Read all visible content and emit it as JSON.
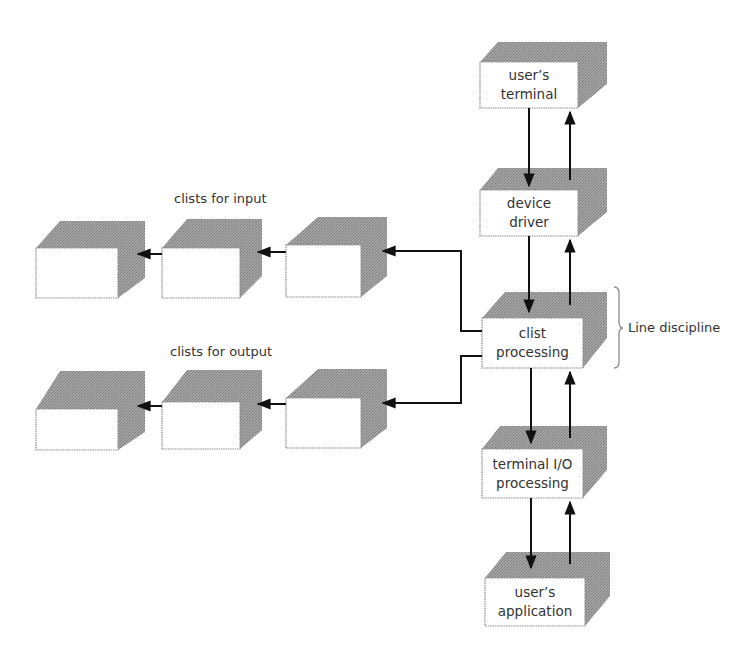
{
  "diagram": {
    "colors": {
      "background": "#ffffff",
      "box_face": "#ffffff",
      "box_shade": "#9a9a9a",
      "box_border": "#8c8c8c",
      "arrow": "#111111",
      "text": "#333333"
    },
    "stack": [
      {
        "id": "users-terminal",
        "line1": "user’s",
        "line2": "terminal"
      },
      {
        "id": "device-driver",
        "line1": "device",
        "line2": "driver"
      },
      {
        "id": "clist-processing",
        "line1": "clist",
        "line2": "processing"
      },
      {
        "id": "terminal-io-processing",
        "line1": "terminal I/O",
        "line2": "processing"
      },
      {
        "id": "users-application",
        "line1": "user’s",
        "line2": "application"
      }
    ],
    "groups": {
      "input": {
        "label": "clists for input",
        "count": 3
      },
      "output": {
        "label": "clists for output",
        "count": 3
      }
    },
    "brace_label": "Line discipline",
    "connections": [
      {
        "from": "users-terminal",
        "to": "device-driver",
        "direction": "bidirectional"
      },
      {
        "from": "device-driver",
        "to": "clist-processing",
        "direction": "bidirectional"
      },
      {
        "from": "clist-processing",
        "to": "terminal-io-processing",
        "direction": "bidirectional"
      },
      {
        "from": "terminal-io-processing",
        "to": "users-application",
        "direction": "bidirectional"
      },
      {
        "from": "clist-processing",
        "to": "clists-for-input",
        "direction": "left"
      },
      {
        "from": "clist-processing",
        "to": "clists-for-output",
        "direction": "left"
      }
    ]
  }
}
